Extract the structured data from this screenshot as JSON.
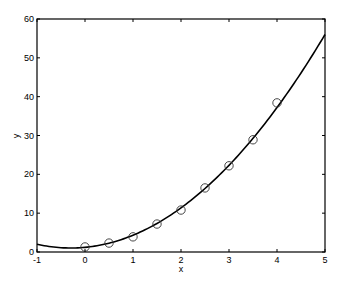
{
  "chart_data": {
    "type": "scatter",
    "title": "",
    "xlabel": "x",
    "ylabel": "y",
    "xlim": [
      -1,
      5
    ],
    "ylim": [
      0,
      60
    ],
    "xticks": [
      -1,
      0,
      1,
      2,
      3,
      4,
      5
    ],
    "yticks": [
      0,
      10,
      20,
      30,
      40,
      50,
      60
    ],
    "grid": false,
    "legend": null,
    "series": [
      {
        "name": "data",
        "style": "circle-markers",
        "x": [
          0,
          0.5,
          1,
          1.5,
          2,
          2.5,
          3,
          3.5,
          4
        ],
        "y": [
          1.3,
          2.3,
          3.9,
          7.2,
          10.8,
          16.5,
          22.2,
          28.9,
          38.4
        ]
      },
      {
        "name": "fit",
        "style": "solid-line",
        "equation": "y = 1.96x^2 + 1.16x + 1.2",
        "coefficients": [
          1.96,
          1.16,
          1.2
        ],
        "x_range": [
          -1,
          5
        ]
      }
    ]
  },
  "labels": {
    "xlabel": "x",
    "ylabel": "y",
    "xticks": [
      "-1",
      "0",
      "1",
      "2",
      "3",
      "4",
      "5"
    ],
    "yticks": [
      "0",
      "10",
      "20",
      "30",
      "40",
      "50",
      "60"
    ]
  }
}
